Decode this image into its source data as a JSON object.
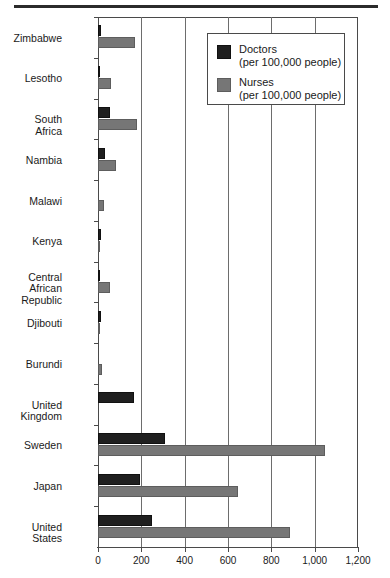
{
  "chart_data": {
    "type": "bar",
    "orientation": "horizontal",
    "title": "",
    "xlabel": "",
    "ylabel": "",
    "xlim": [
      0,
      1200
    ],
    "grid": true,
    "legend_position": "top-right",
    "xticks": [
      "0",
      "200",
      "400",
      "600",
      "800",
      "1,000",
      "1,200"
    ],
    "xtick_values": [
      0,
      200,
      400,
      600,
      800,
      1000,
      1200
    ],
    "categories": [
      "Zimbabwe",
      "Lesotho",
      "South Africa",
      "Nambia",
      "Malawi",
      "Kenya",
      "Central African\nRepublic",
      "Djibouti",
      "Burundi",
      "United Kingdom",
      "Sweden",
      "Japan",
      "United States"
    ],
    "series": [
      {
        "name": "Doctors",
        "unit": "per 100,000 people",
        "color": "#1f1f1f",
        "values": [
          14,
          5,
          56,
          30,
          2,
          13,
          4,
          13,
          2,
          164,
          308,
          193,
          251
        ]
      },
      {
        "name": "Nurses",
        "unit": "per 100,000 people",
        "color": "#767676",
        "values": [
          169,
          60,
          182,
          81,
          26,
          9,
          54,
          6,
          19,
          0,
          1046,
          645,
          885
        ]
      }
    ]
  },
  "legend": {
    "entries": [
      {
        "label": "Doctors",
        "sub": "(per 100,000 people)",
        "swatch": "doctors-swatch"
      },
      {
        "label": "Nurses",
        "sub": "(per 100,000 people)",
        "swatch": "nurses-swatch"
      }
    ]
  }
}
